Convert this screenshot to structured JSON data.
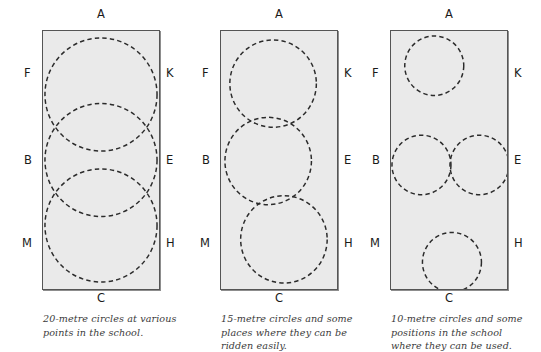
{
  "figure": {
    "background_color": "#ffffff",
    "arena_fill": "#eaeaea",
    "arena_border_color": "#555555",
    "circle_stroke_color": "#2b2b2b",
    "caption_color": "#3b3b3b"
  },
  "panels": [
    {
      "id": "panel-20-metre",
      "markers": {
        "top": "A",
        "bottom": "C",
        "left_top": "F",
        "left_middle": "B",
        "left_bottom": "M",
        "right_top": "K",
        "right_middle": "E",
        "right_bottom": "H"
      },
      "caption_lines": [
        "20-metre circles at various",
        "points in the school."
      ],
      "caption_text": "20-metre circles at various points in the school.",
      "circle_size_metres": 20,
      "circle_count": 3,
      "circles": [
        {
          "cx": 59,
          "cy": 64,
          "r": 57
        },
        {
          "cx": 59,
          "cy": 130,
          "r": 57
        },
        {
          "cx": 59,
          "cy": 196,
          "r": 57
        }
      ]
    },
    {
      "id": "panel-15-metre",
      "markers": {
        "top": "A",
        "bottom": "C",
        "left_top": "F",
        "left_middle": "B",
        "left_bottom": "M",
        "right_top": "K",
        "right_middle": "E",
        "right_bottom": "H"
      },
      "caption_lines": [
        "15-metre circles and some",
        "places where they can be",
        "ridden easily."
      ],
      "caption_text": "15-metre circles and some places where they can be ridden easily.",
      "circle_size_metres": 15,
      "circle_count": 3,
      "circles": [
        {
          "cx": 53,
          "cy": 53,
          "r": 44
        },
        {
          "cx": 48,
          "cy": 131,
          "r": 44
        },
        {
          "cx": 64,
          "cy": 210,
          "r": 44
        }
      ]
    },
    {
      "id": "panel-10-metre",
      "markers": {
        "top": "A",
        "bottom": "C",
        "left_top": "F",
        "left_middle": "B",
        "left_bottom": "M",
        "right_top": "K",
        "right_middle": "E",
        "right_bottom": "H"
      },
      "caption_lines": [
        "10-metre circles and some",
        "positions in the school",
        "where they can be used."
      ],
      "caption_text": "10-metre circles and some positions in the school where they can be used.",
      "circle_size_metres": 10,
      "circle_count": 4,
      "circles": [
        {
          "cx": 44,
          "cy": 35,
          "r": 30
        },
        {
          "cx": 31,
          "cy": 135,
          "r": 30
        },
        {
          "cx": 90,
          "cy": 135,
          "r": 30
        },
        {
          "cx": 62,
          "cy": 233,
          "r": 30
        }
      ]
    }
  ]
}
